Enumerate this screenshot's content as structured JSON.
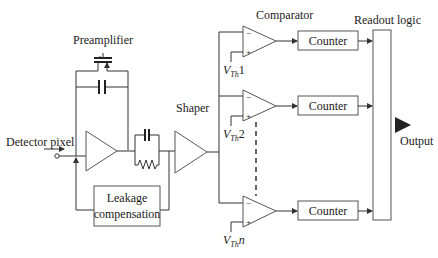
{
  "diagram": {
    "labels": {
      "preamplifier": "Preamplifier",
      "detector_pixel": "Detector pixel",
      "shaper": "Shaper",
      "leakage_line1": "Leakage",
      "leakage_line2": "compensation",
      "comparator": "Comparator",
      "readout_logic": "Readout logic",
      "output": "Output"
    },
    "counters": [
      {
        "label": "Counter"
      },
      {
        "label": "Counter"
      },
      {
        "label": "Counter"
      }
    ],
    "thresholds": [
      {
        "v": "V",
        "sub": "Th",
        "idx": "1"
      },
      {
        "v": "V",
        "sub": "Th",
        "idx": "2"
      },
      {
        "v": "V",
        "sub": "Th",
        "idx": "n"
      }
    ],
    "comparator_pins": {
      "minus": "−",
      "plus": "+"
    }
  }
}
